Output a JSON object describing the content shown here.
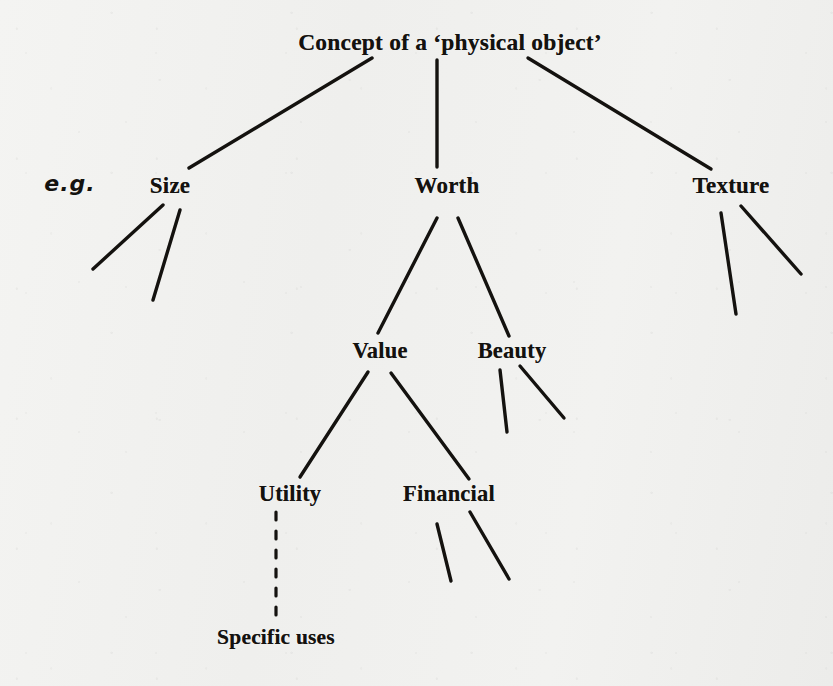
{
  "diagram": {
    "annotation": "e.g.",
    "background_color": "#f1f1ef",
    "ink_color": "#14120f",
    "nodes": [
      {
        "id": "root",
        "label": "Concept of a ‘physical object’",
        "x": 450,
        "y": 42,
        "level": 1
      },
      {
        "id": "size",
        "label": "Size",
        "x": 170,
        "y": 186,
        "level": 2
      },
      {
        "id": "worth",
        "label": "Worth",
        "x": 447,
        "y": 186,
        "level": 2
      },
      {
        "id": "texture",
        "label": "Texture",
        "x": 731,
        "y": 186,
        "level": 2
      },
      {
        "id": "value",
        "label": "Value",
        "x": 380,
        "y": 351,
        "level": 3
      },
      {
        "id": "beauty",
        "label": "Beauty",
        "x": 512,
        "y": 351,
        "level": 3
      },
      {
        "id": "utility",
        "label": "Utility",
        "x": 290,
        "y": 494,
        "level": 4
      },
      {
        "id": "financial",
        "label": "Financial",
        "x": 449,
        "y": 494,
        "level": 4
      },
      {
        "id": "specific",
        "label": "Specific  uses",
        "x": 276,
        "y": 637,
        "level": 5
      }
    ],
    "annotation_position": {
      "x": 70,
      "y": 183
    },
    "edges": [
      {
        "from": "root",
        "to": "size",
        "style": "solid",
        "x1": 372,
        "y1": 58,
        "x2": 189,
        "y2": 168
      },
      {
        "from": "root",
        "to": "worth",
        "style": "solid",
        "x1": 437,
        "y1": 60,
        "x2": 437,
        "y2": 167
      },
      {
        "from": "root",
        "to": "texture",
        "style": "solid",
        "x1": 528,
        "y1": 58,
        "x2": 711,
        "y2": 169
      },
      {
        "from": "size",
        "to": "stub",
        "style": "solid",
        "x1": 163,
        "y1": 205,
        "x2": 93,
        "y2": 269
      },
      {
        "from": "size",
        "to": "stub",
        "style": "solid",
        "x1": 180,
        "y1": 210,
        "x2": 153,
        "y2": 300
      },
      {
        "from": "worth",
        "to": "value",
        "style": "solid",
        "x1": 437,
        "y1": 218,
        "x2": 378,
        "y2": 333
      },
      {
        "from": "worth",
        "to": "beauty",
        "style": "solid",
        "x1": 458,
        "y1": 218,
        "x2": 509,
        "y2": 336
      },
      {
        "from": "texture",
        "to": "stub",
        "style": "solid",
        "x1": 721,
        "y1": 213,
        "x2": 736,
        "y2": 314
      },
      {
        "from": "texture",
        "to": "stub",
        "style": "solid",
        "x1": 741,
        "y1": 206,
        "x2": 801,
        "y2": 274
      },
      {
        "from": "value",
        "to": "utility",
        "style": "solid",
        "x1": 368,
        "y1": 372,
        "x2": 300,
        "y2": 477
      },
      {
        "from": "value",
        "to": "financial",
        "style": "solid",
        "x1": 391,
        "y1": 373,
        "x2": 469,
        "y2": 479
      },
      {
        "from": "beauty",
        "to": "stub",
        "style": "solid",
        "x1": 500,
        "y1": 370,
        "x2": 507,
        "y2": 432
      },
      {
        "from": "beauty",
        "to": "stub",
        "style": "solid",
        "x1": 520,
        "y1": 366,
        "x2": 564,
        "y2": 418
      },
      {
        "from": "utility",
        "to": "specific",
        "style": "dashed",
        "x1": 276,
        "y1": 512,
        "x2": 276,
        "y2": 622
      },
      {
        "from": "financial",
        "to": "stub",
        "style": "solid",
        "x1": 437,
        "y1": 524,
        "x2": 451,
        "y2": 581
      },
      {
        "from": "financial",
        "to": "stub",
        "style": "solid",
        "x1": 470,
        "y1": 512,
        "x2": 509,
        "y2": 579
      }
    ]
  }
}
